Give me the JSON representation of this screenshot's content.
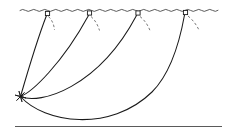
{
  "figure": {
    "background_color": "#ffffff",
    "line_color": "#1a1a1a",
    "water_line_color": "#4a4a4a",
    "seabed_color": "#5a5a5a",
    "dashed_arc_color": "#6a6a6a"
  },
  "canvas": {
    "width": 228,
    "height": 134
  },
  "scene": {
    "water_surface": {
      "label": "water-surface",
      "y": 10,
      "x_start": 20,
      "x_end": 222,
      "wave_amplitude": 1.6,
      "wave_period": 11,
      "path": "M20,10.4 q2.75,-2.0 5.5,0 t5.5,0 t5.5,0 t5.5,0 t5.5,0 t5.5,0 t5.5,0 t5.5,0 t5.5,0 t5.5,0 t5.5,0 t5.5,0 t5.5,0 t5.5,0 t5.5,0 t5.5,0 t5.5,0 t5.5,0 t5.5,0 t5.5,0 t5.5,0 t5.5,0 t5.5,0 t5.5,0 t5.5,0 t5.5,0 t5.5,0 t5.5,0 t5.5,0 t5.5,0 t5.5,0 t5.5,0 t5.5,0 t5.5,0 t5.5,0 t5.5,0"
    },
    "seabed": {
      "label": "seabed",
      "y": 126.5,
      "x_start": 15,
      "x_end": 222,
      "path": "M15,126.5 L222,126.5"
    },
    "anchor": {
      "label": "anchor-point",
      "x": 20.5,
      "y": 96.5,
      "marker": "asterisk",
      "ray_length": 5.2
    }
  },
  "buoys": [
    {
      "id": "buoy-1",
      "label": "Buoy position 1",
      "x": 47.5,
      "y": 13.5,
      "size": 4.2,
      "offset_from_anchor": 27,
      "line_path": "M20.5,96.5 C27,74 37,40 46.5,15.5",
      "arc_path": "M48.5,16.5 C52.5,20.5 54,25 54.5,30"
    },
    {
      "id": "buoy-2",
      "label": "Buoy position 2",
      "x": 89.5,
      "y": 13.0,
      "size": 4.2,
      "offset_from_anchor": 69,
      "line_path": "M20.5,96.5 C32,92 62,64 88.5,15.5",
      "arc_path": "M91,16.5 C95.5,20.5 98,25.5 99.5,30.5"
    },
    {
      "id": "buoy-3",
      "label": "Buoy position 3",
      "x": 138.0,
      "y": 13.0,
      "size": 4.2,
      "offset_from_anchor": 117,
      "line_path": "M20.5,96.5 C40,105 98,88 136.5,15.5",
      "arc_path": "M140,16.5 C145,20.5 148,25.5 150,30.5"
    },
    {
      "id": "buoy-4",
      "label": "Buoy position 4",
      "x": 185.5,
      "y": 12.5,
      "size": 4.2,
      "offset_from_anchor": 165,
      "line_path": "M20.5,96.5 C44,123 110,133 152,92 C172,72 180,40 184.5,15",
      "arc_path": "M188,16 C193,20 196.5,25 199,30"
    }
  ]
}
